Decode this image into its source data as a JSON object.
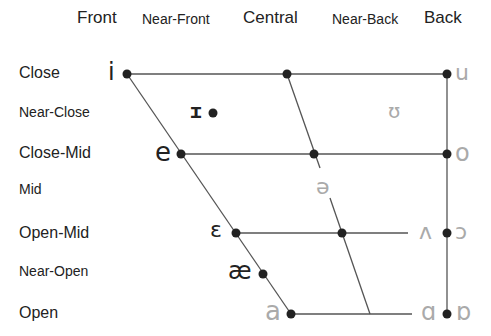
{
  "columns": {
    "front": "Front",
    "near_front": "Near-Front",
    "central": "Central",
    "near_back": "Near-Back",
    "back": "Back"
  },
  "rows": {
    "close": "Close",
    "near_close": "Near-Close",
    "close_mid": "Close-Mid",
    "mid": "Mid",
    "open_mid": "Open-Mid",
    "near_open": "Near-Open",
    "open": "Open"
  },
  "vowels": {
    "close_front": "i",
    "close_back": "u",
    "near_close_front": "ɪ",
    "near_close_back": "ʊ",
    "close_mid_front": "e",
    "close_mid_back": "o",
    "mid_central": "ə",
    "open_mid_front": "ɛ",
    "open_mid_back_unrounded": "ʌ",
    "open_mid_back_rounded": "ɔ",
    "near_open_front": "æ",
    "open_front": "a",
    "open_back_unrounded": "ɑ",
    "open_back_rounded": "ɒ"
  },
  "colors": {
    "line": "#555555",
    "dot": "#222222",
    "dark_symbol": "#222222",
    "light_symbol": "#aaaaaa"
  }
}
